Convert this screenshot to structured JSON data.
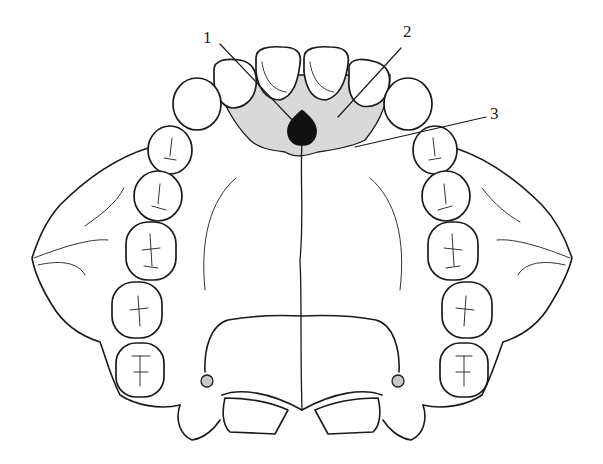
{
  "diagram": {
    "labels": [
      {
        "id": "1",
        "text": "1",
        "x": 203,
        "y": 28,
        "target": "incisive papilla / foramen (dark)"
      },
      {
        "id": "2",
        "text": "2",
        "x": 403,
        "y": 22,
        "target": "anterior palatal region (shaded)"
      },
      {
        "id": "3",
        "text": "3",
        "x": 490,
        "y": 104,
        "target": "boundary of shaded region"
      }
    ],
    "colors": {
      "line": "#1a1a1a",
      "shaded_region": "#d9d9d9",
      "papilla": "#111111",
      "small_foramen": "#c8c8c8",
      "background": "#ffffff"
    }
  }
}
